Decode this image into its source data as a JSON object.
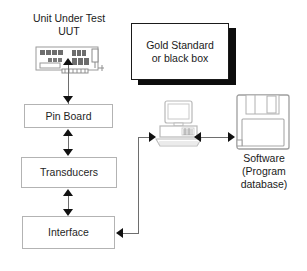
{
  "diagram": {
    "title_block": {
      "line1": "Unit Under Test",
      "line2": "UUT"
    },
    "gold_standard": {
      "line1": "Gold Standard",
      "line2": "or black box",
      "text": "Gold Standard\nor black box"
    },
    "boxes": [
      {
        "id": "pin-board",
        "label": "Pin Board"
      },
      {
        "id": "transducers",
        "label": "Transducers"
      },
      {
        "id": "interface",
        "label": "Interface"
      }
    ],
    "software": {
      "line1": "Software",
      "line2": "(Program",
      "line3": "database)",
      "text": "Software\n(Program\ndatabase)"
    },
    "icons": {
      "circuit_board": "circuit-board-icon",
      "computer": "desktop-computer-icon",
      "floppy_disk": "floppy-disk-icon"
    },
    "colors": {
      "box_border": "#b3b3b3",
      "connector": "#6e6e6e",
      "arrow_fill": "#111111",
      "shadow": "#0d0d0d",
      "text": "#1a1a1a",
      "background": "#ffffff"
    }
  }
}
